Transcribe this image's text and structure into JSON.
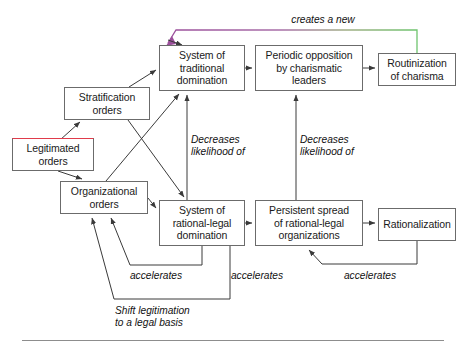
{
  "diagram": {
    "type": "flow-diagram",
    "title_text": "",
    "colors": {
      "box_border": "#6b6b6b",
      "highlight_border": "#e03b4b",
      "arrow": "#3a3a3a",
      "gradient_start": "#9b4f9b",
      "gradient_end": "#6ec46e",
      "text": "#1a1a1a",
      "rule": "#8d8d8d"
    },
    "nodes": [
      {
        "id": "legitimated-orders",
        "label": "Legitimated\norders",
        "x": 12,
        "y": 138,
        "w": 82,
        "h": 33,
        "highlight": true
      },
      {
        "id": "stratification-orders",
        "label": "Stratification\norders",
        "x": 64,
        "y": 87,
        "w": 86,
        "h": 33,
        "highlight": false
      },
      {
        "id": "organizational-orders",
        "label": "Organizational\norders",
        "x": 60,
        "y": 181,
        "w": 88,
        "h": 33,
        "highlight": false
      },
      {
        "id": "system-traditional-domination",
        "label": "System of\ntraditional\ndomination",
        "x": 159,
        "y": 45,
        "w": 86,
        "h": 46,
        "highlight": false
      },
      {
        "id": "system-rational-legal-domination",
        "label": "System of\nrational-legal\ndomination",
        "x": 159,
        "y": 200,
        "w": 86,
        "h": 46,
        "highlight": false
      },
      {
        "id": "periodic-opposition",
        "label": "Periodic opposition\nby charismatic\nleaders",
        "x": 255,
        "y": 45,
        "w": 108,
        "h": 46,
        "highlight": false
      },
      {
        "id": "persistent-spread",
        "label": "Persistent spread\nof rational-legal\norganizations",
        "x": 255,
        "y": 200,
        "w": 108,
        "h": 46,
        "highlight": false
      },
      {
        "id": "routinization-of-charisma",
        "label": "Routinization\nof charisma",
        "x": 378,
        "y": 53,
        "w": 78,
        "h": 33,
        "highlight": false
      },
      {
        "id": "rationalization",
        "label": "Rationalization",
        "x": 378,
        "y": 208,
        "w": 78,
        "h": 33,
        "highlight": false
      }
    ],
    "edge_labels": [
      {
        "id": "creates-a-new",
        "text": "creates a new",
        "x": 273,
        "y": 14,
        "w": 100,
        "align": "centered"
      },
      {
        "id": "decreases-likelihood-left",
        "text": "Decreases\nlikelihood of",
        "x": 191,
        "y": 134,
        "w": 78,
        "align": "left"
      },
      {
        "id": "decreases-likelihood-right",
        "text": "Decreases\nlikelihood of",
        "x": 300,
        "y": 134,
        "w": 78,
        "align": "left"
      },
      {
        "id": "accelerates-left",
        "text": "accelerates",
        "x": 123,
        "y": 270,
        "w": 66,
        "align": "centered"
      },
      {
        "id": "accelerates-middle",
        "text": "accelerates",
        "x": 224,
        "y": 270,
        "w": 66,
        "align": "centered"
      },
      {
        "id": "accelerates-right",
        "text": "accelerates",
        "x": 337,
        "y": 270,
        "w": 66,
        "align": "centered"
      },
      {
        "id": "shift-legitimation",
        "text": "Shift legitimation\nto a legal basis",
        "x": 115,
        "y": 305,
        "w": 104,
        "align": "left"
      }
    ],
    "edges": [
      {
        "id": "legitimated-to-stratification",
        "from": "legitimated-orders",
        "to": "stratification-orders",
        "label": ""
      },
      {
        "id": "legitimated-to-organizational",
        "from": "legitimated-orders",
        "to": "organizational-orders",
        "label": ""
      },
      {
        "id": "stratification-to-traditional",
        "from": "stratification-orders",
        "to": "system-traditional-domination",
        "label": ""
      },
      {
        "id": "stratification-to-rational-legal",
        "from": "stratification-orders",
        "to": "system-rational-legal-domination",
        "label": ""
      },
      {
        "id": "organizational-to-traditional",
        "from": "organizational-orders",
        "to": "system-traditional-domination",
        "label": ""
      },
      {
        "id": "organizational-to-rational-legal",
        "from": "organizational-orders",
        "to": "system-rational-legal-domination",
        "label": ""
      },
      {
        "id": "traditional-to-periodic",
        "from": "system-traditional-domination",
        "to": "periodic-opposition",
        "label": ""
      },
      {
        "id": "periodic-to-routinization",
        "from": "periodic-opposition",
        "to": "routinization-of-charisma",
        "label": ""
      },
      {
        "id": "routinization-creates-new-traditional",
        "from": "routinization-of-charisma",
        "to": "system-traditional-domination",
        "label": "creates a new"
      },
      {
        "id": "rational-legal-decreases-traditional",
        "from": "system-rational-legal-domination",
        "to": "system-traditional-domination",
        "label": "Decreases likelihood of"
      },
      {
        "id": "persistent-decreases-periodic",
        "from": "persistent-spread",
        "to": "periodic-opposition",
        "label": "Decreases likelihood of"
      },
      {
        "id": "rational-legal-to-persistent",
        "from": "system-rational-legal-domination",
        "to": "persistent-spread",
        "label": ""
      },
      {
        "id": "persistent-to-rationalization",
        "from": "persistent-spread",
        "to": "rationalization",
        "label": ""
      },
      {
        "id": "rational-legal-accelerates-organizational",
        "from": "system-rational-legal-domination",
        "to": "organizational-orders",
        "label": "accelerates"
      },
      {
        "id": "persistent-accelerates-organizational",
        "from": "persistent-spread",
        "to": "organizational-orders",
        "label": "Shift legitimation to a legal basis"
      },
      {
        "id": "rationalization-accelerates-persistent",
        "from": "rationalization",
        "to": "persistent-spread",
        "label": "accelerates"
      }
    ]
  }
}
